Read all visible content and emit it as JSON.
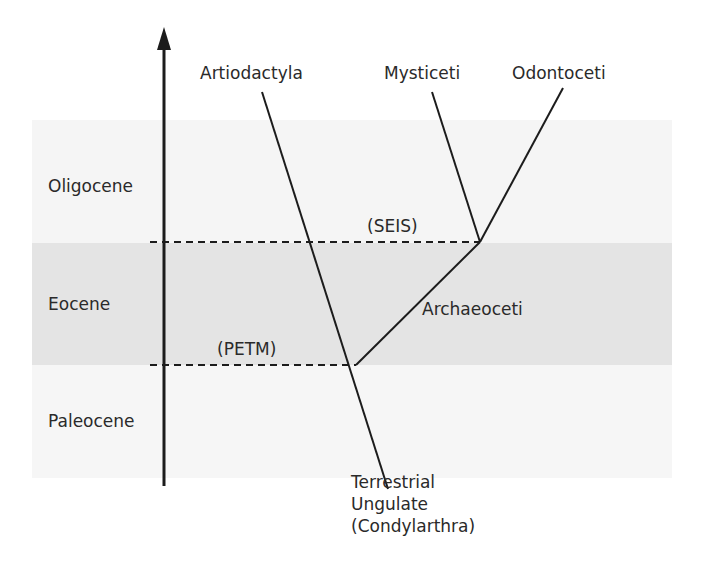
{
  "colors": {
    "band_oligocene": "#f5f5f5",
    "band_eocene": "#e4e4e4",
    "band_paleocene": "#f6f6f6",
    "line": "#1c1c1c"
  },
  "epochs": [
    {
      "name": "Oligocene"
    },
    {
      "name": "Eocene"
    },
    {
      "name": "Paleocene"
    }
  ],
  "events": {
    "seis": "(SEIS)",
    "petm": "(PETM)"
  },
  "taxa": {
    "artiodactyla": "Artiodactyla",
    "mysticeti": "Mysticeti",
    "odontoceti": "Odontoceti",
    "archaeoceti": "Archaeoceti",
    "ancestor": "Terrestrial\nUngulate\n(Condylarthra)"
  }
}
